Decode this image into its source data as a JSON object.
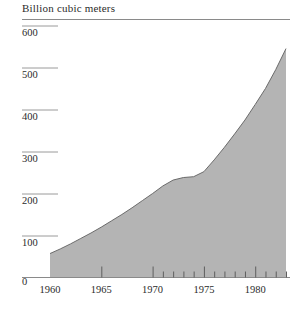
{
  "chart_data": {
    "type": "area",
    "title": "Billion cubic meters",
    "xlabel": "",
    "ylabel": "Billion cubic meters",
    "ylim": [
      0,
      600
    ],
    "xlim": [
      1960,
      1983
    ],
    "grid": true,
    "legend": null,
    "yticks": [
      0,
      100,
      200,
      300,
      400,
      500,
      600
    ],
    "ytick_labels": [
      "0",
      "100",
      "200",
      "300",
      "400",
      "500",
      "600"
    ],
    "xticks": [
      1960,
      1965,
      1970,
      1975,
      1980
    ],
    "xtick_labels": [
      "1960",
      "1965",
      "1970",
      "1975",
      "1980"
    ],
    "minor_xticks": [
      1971,
      1972,
      1973,
      1974,
      1976,
      1977,
      1978,
      1979,
      1981,
      1982,
      1983
    ],
    "x": [
      1960,
      1961,
      1962,
      1963,
      1964,
      1965,
      1966,
      1967,
      1968,
      1969,
      1970,
      1971,
      1972,
      1973,
      1974,
      1975,
      1976,
      1977,
      1978,
      1979,
      1980,
      1981,
      1982,
      1983
    ],
    "values": [
      57,
      68,
      80,
      93,
      106,
      120,
      135,
      150,
      166,
      183,
      200,
      218,
      232,
      238,
      240,
      252,
      280,
      310,
      342,
      375,
      412,
      450,
      495,
      545
    ],
    "series": [
      {
        "name": "Billion cubic meters",
        "values": [
          57,
          68,
          80,
          93,
          106,
          120,
          135,
          150,
          166,
          183,
          200,
          218,
          232,
          238,
          240,
          252,
          280,
          310,
          342,
          375,
          412,
          450,
          495,
          545
        ]
      }
    ],
    "fill_color": "#b4b4b4",
    "line_color": "#6b6b6b",
    "axis_color": "#8a8a8a",
    "grid_color": "#9a9a9a",
    "zero_label": "0"
  }
}
